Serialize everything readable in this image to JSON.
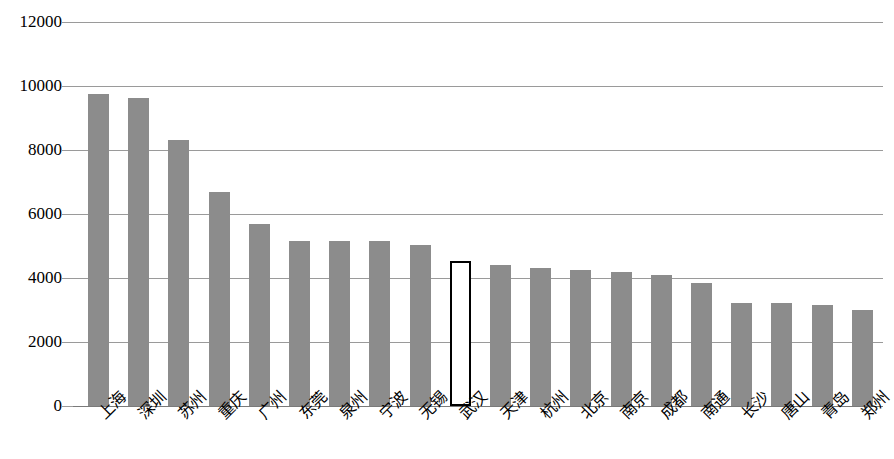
{
  "chart_data": {
    "type": "bar",
    "title": "",
    "subtitle": "",
    "xlabel": "",
    "ylabel": "",
    "ylim": [
      0,
      12000
    ],
    "ytick_interval": 2000,
    "yticks": [
      12000,
      10000,
      8000,
      6000,
      4000,
      2000,
      0
    ],
    "ytick_labels": [
      "12000",
      "10000",
      "8000",
      "6000",
      "4000",
      "2000",
      "0"
    ],
    "grid": true,
    "grid_axis": "y",
    "legend": false,
    "legend_position": "none",
    "categories": [
      "上海",
      "深圳",
      "苏州",
      "重庆",
      "广州",
      "东莞",
      "泉州",
      "宁波",
      "无锡",
      "武汉",
      "天津",
      "杭州",
      "北京",
      "南京",
      "成都",
      "南通",
      "长沙",
      "唐山",
      "青岛",
      "郑州"
    ],
    "values": [
      9750,
      9640,
      8300,
      6680,
      5700,
      5160,
      5150,
      5150,
      5030,
      4530,
      4400,
      4300,
      4250,
      4200,
      4100,
      3830,
      3230,
      3230,
      3160,
      3000
    ],
    "highlight_category": "武汉",
    "highlight_index": 9,
    "bar_color": "#8c8c8c",
    "highlight_fill": "#ffffff",
    "highlight_border": "#000000",
    "gridline_color": "#9a9a9a",
    "background": "#ffffff",
    "axis_label_rotation": -45
  }
}
